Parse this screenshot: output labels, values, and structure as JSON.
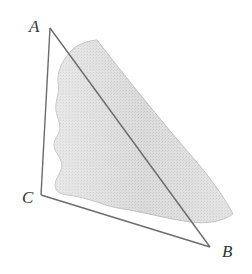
{
  "diagram": {
    "type": "triangle-with-shaded-region",
    "vertices": [
      {
        "label": "A",
        "x": 50,
        "y": 28,
        "label_x": 29,
        "label_y": 18
      },
      {
        "label": "C",
        "x": 41,
        "y": 195,
        "label_x": 22,
        "label_y": 189
      },
      {
        "label": "B",
        "x": 210,
        "y": 247,
        "label_x": 222,
        "label_y": 243
      }
    ],
    "edges": [
      {
        "from": "A",
        "to": "B"
      },
      {
        "from": "B",
        "to": "C"
      },
      {
        "from": "C",
        "to": "A"
      }
    ],
    "shaded_region": {
      "description": "irregular stippled gray region overlapping the triangle, crossing side AB",
      "fill": "#d9d9d9",
      "stroke": "#bdbdbd"
    },
    "colors": {
      "edge": "#6b6b6b",
      "label": "#333333",
      "background": "#ffffff"
    }
  }
}
